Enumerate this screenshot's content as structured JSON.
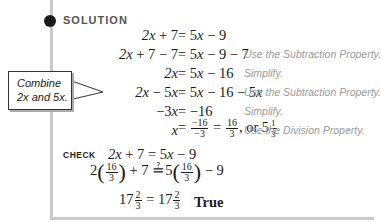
{
  "section": {
    "label": "SOLUTION",
    "callout": {
      "line1": "Combine",
      "line2": "2x and 5x."
    }
  },
  "solution_steps": [
    {
      "left": "2x + 7",
      "right": "5x − 9",
      "note": ""
    },
    {
      "left": "2x + 7 − 7",
      "right": "5x − 9 − 7",
      "note": "Use the Subtraction Property."
    },
    {
      "left": "2x",
      "right": "5x − 16",
      "note": "Simplify."
    },
    {
      "left": "2x − 5x",
      "right": "5x − 16 − 5x",
      "note": "Use the Subtraction Property."
    },
    {
      "left": "−3x",
      "right": "−16",
      "note": "Simplify."
    },
    {
      "left": "x",
      "right": "−16/−3 = 16/3, or 5 1/3",
      "note": "Use the Division Property."
    }
  ],
  "step6": {
    "frac1_num": "−16",
    "frac1_den": "−3",
    "frac2_num": "16",
    "frac2_den": "3",
    "or_text": ", or 5",
    "mixed_num": "1",
    "mixed_den": "3"
  },
  "check": {
    "label": "CHECK",
    "line1": {
      "left": "2x + 7",
      "right": "5x − 9"
    },
    "line2": {
      "coef_left": "2",
      "num": "16",
      "den": "3",
      "mid": "+ 7",
      "rel": "≟",
      "coef_right": "5",
      "tail": "− 9"
    },
    "line3": {
      "whole": "17",
      "num": "2",
      "den": "3",
      "result": "True"
    }
  }
}
